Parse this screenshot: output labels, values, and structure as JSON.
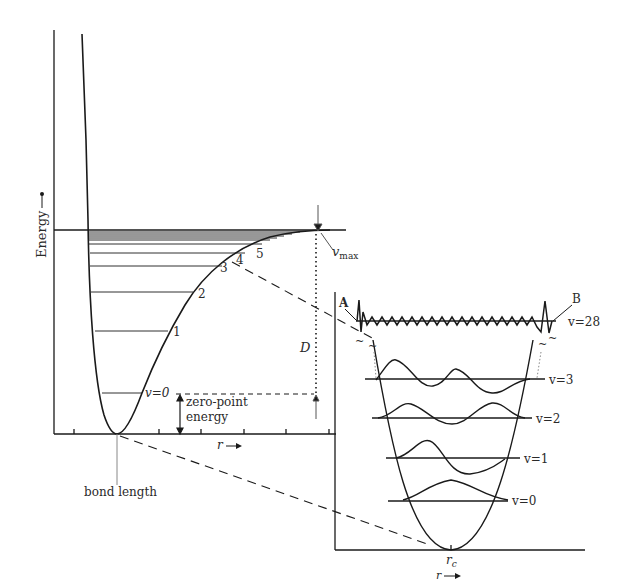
{
  "diagram": {
    "main_plot": {
      "y_axis_label": "Energy",
      "x_axis_label": "r",
      "level_labels": [
        "v=0",
        "1",
        "2",
        "3",
        "4",
        "5"
      ],
      "vmax_label": "v",
      "vmax_sub": "max",
      "dissociation_label": "D",
      "zero_point_line1": "zero-point",
      "zero_point_line2": "energy",
      "bond_length_label": "bond length"
    },
    "inset": {
      "x_axis_label": "r",
      "equilibrium_label": "r",
      "equilibrium_sub": "c",
      "level_labels": [
        "v=0",
        "v=1",
        "v=2",
        "v=3",
        "v=28"
      ],
      "turning_point_a": "A",
      "turning_point_b": "B"
    },
    "colors": {
      "line": "#1a1a1a",
      "background": "#ffffff"
    }
  }
}
